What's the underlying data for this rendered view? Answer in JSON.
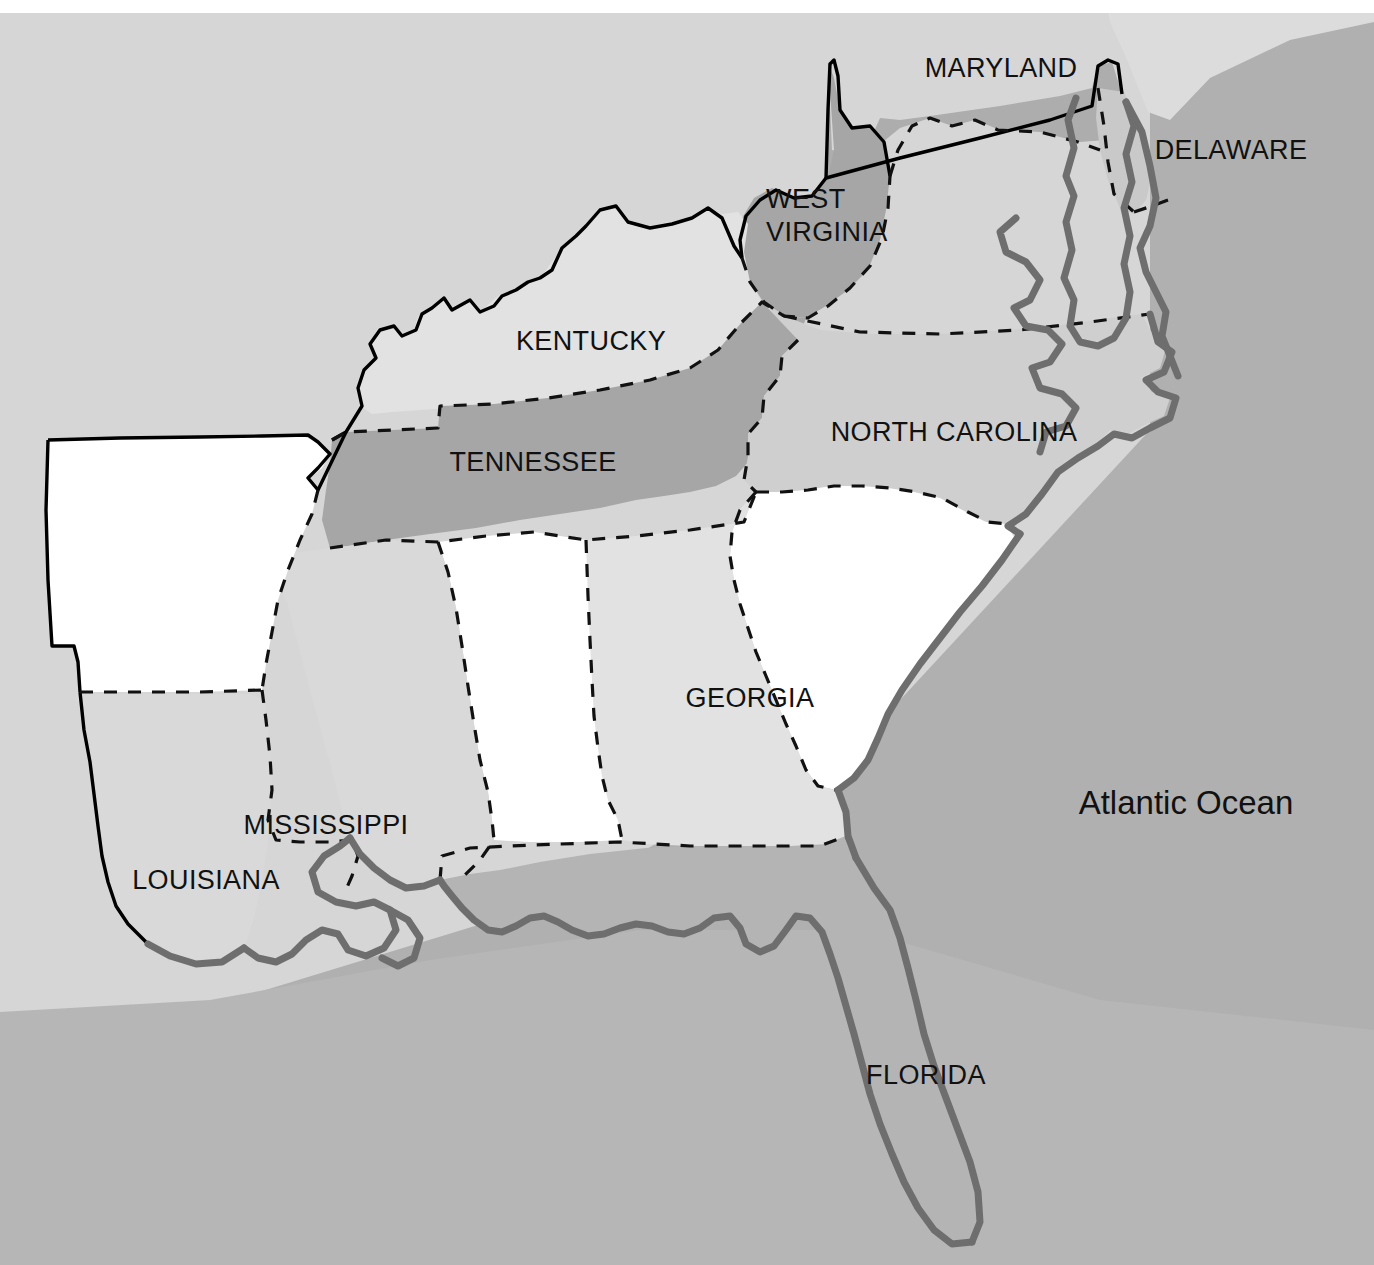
{
  "map": {
    "title_fragment": "g",
    "ocean_label": "Atlantic Ocean",
    "colors": {
      "ocean": "#b0b0b0",
      "land_backdrop": "#d9d9d9",
      "neighbor_land": "#d4d4d4",
      "shade_dark": "#a6a6a6",
      "shade_medium": "#adadad",
      "shade_light": "#e2e2e2",
      "shade_lighter": "#dedede",
      "white": "#ffffff",
      "border_solid": "#000000",
      "border_dashed": "#111111",
      "coastline": "#6e6e6e",
      "label_text": "#111111"
    },
    "states": [
      {
        "id": "maryland",
        "label": "MARYLAND",
        "label_x": 1001,
        "label_y": 70,
        "fill": "#adadad",
        "multiline": false
      },
      {
        "id": "delaware",
        "label": "DELAWARE",
        "label_x": 1231,
        "label_y": 152,
        "fill": "#c9c9c9",
        "multiline": false
      },
      {
        "id": "west-virginia",
        "label": "WEST VIRGINIA",
        "label_x": 766,
        "label_y": 201,
        "fill": "#a6a6a6",
        "multiline": true,
        "lines": [
          "WEST",
          "VIRGINIA"
        ]
      },
      {
        "id": "kentucky",
        "label": "KENTUCKY",
        "label_x": 591,
        "label_y": 343,
        "fill": "#e2e2e2",
        "multiline": false
      },
      {
        "id": "tennessee",
        "label": "TENNESSEE",
        "label_x": 533,
        "label_y": 464,
        "fill": "#a6a6a6",
        "multiline": false
      },
      {
        "id": "north-carolina",
        "label": "NORTH CAROLINA",
        "label_x": 954,
        "label_y": 434,
        "fill": "#cfcfcf",
        "multiline": false
      },
      {
        "id": "georgia",
        "label": "GEORGIA",
        "label_x": 750,
        "label_y": 700,
        "fill": "#e2e2e2",
        "multiline": false
      },
      {
        "id": "mississippi",
        "label": "MISSISSIPPI",
        "label_x": 326,
        "label_y": 827,
        "fill": "#d9d9d9",
        "multiline": false
      },
      {
        "id": "louisiana",
        "label": "LOUISIANA",
        "label_x": 206,
        "label_y": 882,
        "fill": "#d9d9d9",
        "multiline": false
      },
      {
        "id": "florida",
        "label": "FLORIDA",
        "label_x": 926,
        "label_y": 1077,
        "fill": "#b4b4b4",
        "multiline": false
      },
      {
        "id": "virginia",
        "label": "",
        "label_x": 0,
        "label_y": 0,
        "fill": "#ffffff",
        "multiline": false
      },
      {
        "id": "south-carolina",
        "label": "",
        "label_x": 0,
        "label_y": 0,
        "fill": "#ffffff",
        "multiline": false
      },
      {
        "id": "arkansas",
        "label": "",
        "label_x": 0,
        "label_y": 0,
        "fill": "#ffffff",
        "multiline": false
      },
      {
        "id": "alabama",
        "label": "",
        "label_x": 0,
        "label_y": 0,
        "fill": "#ffffff",
        "multiline": false
      }
    ],
    "ocean_label_x": 1186,
    "ocean_label_y": 805
  }
}
